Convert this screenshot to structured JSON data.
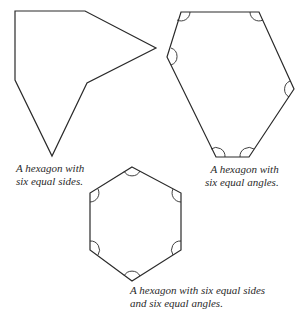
{
  "figures": [
    {
      "id": "irregular",
      "caption_lines": [
        "A hexagon with",
        "six equal sides."
      ]
    },
    {
      "id": "equiangular",
      "caption_lines": [
        "A hexagon with",
        "six equal angles."
      ]
    },
    {
      "id": "regular",
      "caption_lines": [
        "A hexagon with six equal sides",
        "and six equal angles."
      ]
    }
  ],
  "colors": {
    "stroke": "#2a2a2a",
    "background": "#ffffff"
  }
}
